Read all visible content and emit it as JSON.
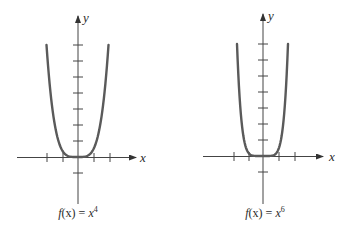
{
  "figure": {
    "graphs": [
      {
        "id": "left",
        "x_axis_label": "x",
        "y_axis_label": "y",
        "caption": "f(x) = x⁴",
        "caption_parts": {
          "fn": "f",
          "arg": "(x)",
          "eq": " = ",
          "base": "x",
          "exp": "4"
        },
        "exponent": 4
      },
      {
        "id": "right",
        "x_axis_label": "x",
        "y_axis_label": "y",
        "caption": "f(x) = x⁶",
        "caption_parts": {
          "fn": "f",
          "arg": "(x)",
          "eq": " = ",
          "base": "x",
          "exp": "6"
        },
        "exponent": 6
      }
    ],
    "colors": {
      "curve": "#5a5a5a",
      "axis": "#333333",
      "text": "#2b2b2b"
    }
  },
  "chart_data": [
    {
      "type": "line",
      "title": "f(x) = x^4",
      "xlabel": "x",
      "ylabel": "y",
      "x_ticks": [
        -2,
        -1,
        1,
        2
      ],
      "y_ticks": [
        -1,
        1,
        2,
        3,
        4,
        5,
        6,
        7
      ],
      "grid": false,
      "series": [
        {
          "name": "f(x) = x^4",
          "x": [
            -1.94,
            -1.5,
            -1,
            -0.5,
            0,
            0.5,
            1,
            1.5,
            1.94
          ],
          "y": [
            14.2,
            5.06,
            1,
            0.06,
            0,
            0.06,
            1,
            5.06,
            14.2
          ]
        }
      ]
    },
    {
      "type": "line",
      "title": "f(x) = x^6",
      "xlabel": "x",
      "ylabel": "y",
      "x_ticks": [
        -2,
        -1,
        1,
        2
      ],
      "y_ticks": [
        -1,
        1,
        2,
        3,
        4,
        5,
        6,
        7
      ],
      "grid": false,
      "series": [
        {
          "name": "f(x) = x^6",
          "x": [
            -1.6,
            -1.25,
            -1,
            -0.5,
            0,
            0.5,
            1,
            1.25,
            1.6
          ],
          "y": [
            16.8,
            3.81,
            1,
            0.02,
            0,
            0.02,
            1,
            3.81,
            16.8
          ]
        }
      ]
    }
  ]
}
